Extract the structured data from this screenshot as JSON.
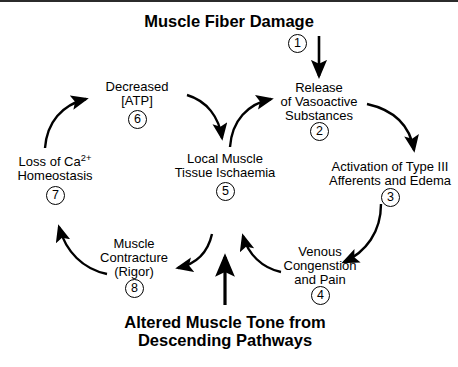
{
  "diagram": {
    "title": "Muscle Fiber Damage",
    "caption_line1": "Altered Muscle Tone from",
    "caption_line2": "Descending Pathways",
    "style": {
      "ink": "#000000",
      "background": "#ffffff",
      "border": "#2b2b2b"
    },
    "nodes": [
      {
        "id": "muscle-fiber-damage",
        "step": "",
        "lines": [
          "Muscle Fiber Damage"
        ]
      },
      {
        "id": "release-vasoactive-substances",
        "step": "2",
        "lines": [
          "Release",
          "of Vasoactive",
          "Substances"
        ]
      },
      {
        "id": "activation-type-iii-afferents",
        "step": "3",
        "lines": [
          "Activation of Type III",
          "Afferents and Edema"
        ]
      },
      {
        "id": "venous-congestion-pain",
        "step": "4",
        "lines": [
          "Venous",
          "Congenstion",
          "and Pain"
        ]
      },
      {
        "id": "local-muscle-tissue-ischaemia",
        "step": "5",
        "lines": [
          "Local Muscle",
          "Tissue Ischaemia"
        ]
      },
      {
        "id": "decreased-atp",
        "step": "6",
        "lines": [
          "Decreased",
          "[ATP]"
        ]
      },
      {
        "id": "loss-of-calcium-homeostasis",
        "step": "7",
        "lines": [
          "Loss of Ca2+",
          "Homeostasis"
        ]
      },
      {
        "id": "muscle-contracture-rigor",
        "step": "8",
        "lines": [
          "Muscle",
          "Contracture",
          "(Rigor)"
        ]
      }
    ],
    "steps": {
      "one": "1",
      "two": "2",
      "three": "3",
      "four": "4",
      "five": "5",
      "six": "6",
      "seven": "7",
      "eight": "8"
    },
    "labels": {
      "release_l1": "Release",
      "release_l2": "of Vasoactive",
      "release_l3": "Substances",
      "activation_l1": "Activation of Type III",
      "activation_l2": "Afferents and Edema",
      "venous_l1": "Venous",
      "venous_l2": "Congenstion",
      "venous_l3": "and Pain",
      "ischaemia_l1": "Local Muscle",
      "ischaemia_l2": "Tissue Ischaemia",
      "atp_l1": "Decreased",
      "atp_l2": "[ATP]",
      "calcium_l1_pre": "Loss of Ca",
      "calcium_l1_sup": "2+",
      "calcium_l2": "Homeostasis",
      "contracture_l1": "Muscle",
      "contracture_l2": "Contracture",
      "contracture_l3": "(Rigor)"
    },
    "arrows": [
      {
        "id": "damage-to-release",
        "from": "muscle-fiber-damage",
        "to": "release-vasoactive-substances",
        "shape": "straight-down"
      },
      {
        "id": "release-to-activation",
        "from": "release-vasoactive-substances",
        "to": "activation-type-iii-afferents",
        "shape": "curve-right-down"
      },
      {
        "id": "activation-to-venous",
        "from": "activation-type-iii-afferents",
        "to": "venous-congestion-pain",
        "shape": "curve-down-left"
      },
      {
        "id": "venous-to-ischaemia",
        "from": "venous-congestion-pain",
        "to": "local-muscle-tissue-ischaemia",
        "shape": "curve-left-up"
      },
      {
        "id": "ischaemia-to-atp-path",
        "from": "local-muscle-tissue-ischaemia",
        "to": "release-vasoactive-substances",
        "shape": "curve-up-right"
      },
      {
        "id": "atp-down-to-ischaemia",
        "from": "decreased-atp",
        "to": "local-muscle-tissue-ischaemia",
        "shape": "curve-down-right"
      },
      {
        "id": "calcium-to-atp",
        "from": "loss-of-calcium-homeostasis",
        "to": "decreased-atp",
        "shape": "curve-up-right"
      },
      {
        "id": "contracture-to-calcium",
        "from": "muscle-contracture-rigor",
        "to": "loss-of-calcium-homeostasis",
        "shape": "curve-left-up"
      },
      {
        "id": "ischaemia-to-contracture",
        "from": "local-muscle-tissue-ischaemia",
        "to": "muscle-contracture-rigor",
        "shape": "curve-down-left"
      },
      {
        "id": "caption-to-ischaemia",
        "from": "altered-muscle-tone",
        "to": "local-muscle-tissue-ischaemia",
        "shape": "straight-up"
      }
    ]
  }
}
